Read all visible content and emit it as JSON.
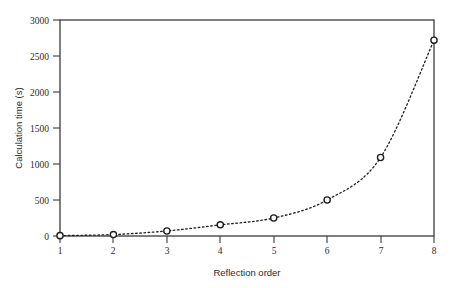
{
  "chart_data": {
    "type": "scatter",
    "title": "",
    "xlabel": "Reflection order",
    "ylabel": "Calculation time (s)",
    "x": [
      1,
      2,
      3,
      4,
      5,
      6,
      7,
      8
    ],
    "values": [
      5,
      20,
      70,
      155,
      250,
      500,
      1090,
      2720
    ],
    "series": [
      {
        "name": "Calculation time",
        "x": [
          1,
          2,
          3,
          4,
          5,
          6,
          7,
          8
        ],
        "values": [
          5,
          20,
          70,
          155,
          250,
          500,
          1090,
          2720
        ]
      }
    ],
    "xlim": [
      1,
      8
    ],
    "ylim": [
      0,
      3000
    ],
    "xticks": [
      1,
      2,
      3,
      4,
      5,
      6,
      7,
      8
    ],
    "yticks": [
      0,
      500,
      1000,
      1500,
      2000,
      2500,
      3000
    ],
    "xtick_labels": [
      "1",
      "2",
      "3",
      "4",
      "5",
      "6",
      "7",
      "8"
    ],
    "ytick_labels": [
      "0",
      "500",
      "1000",
      "1500",
      "2000",
      "2500",
      "3000"
    ],
    "grid": false,
    "legend": false,
    "legend_position": "none",
    "marker_style": "open-circle",
    "line_style": "dotted",
    "frame": "box",
    "colors": {
      "line": "#242424",
      "marker_fill": "#ffffff",
      "marker_stroke": "#1c1c1c",
      "axis": "#3a3a3a",
      "text": "#2b2b2b",
      "background": "#ffffff"
    }
  },
  "axes": {
    "x_title": "Reflection order",
    "y_title": "Calculation time (s)"
  }
}
